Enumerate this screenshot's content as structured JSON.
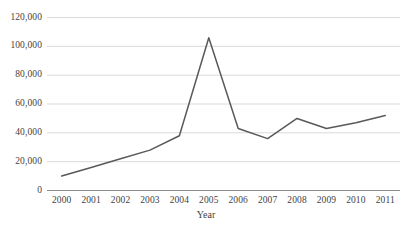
{
  "chart_data": {
    "type": "line",
    "title": "",
    "xlabel": "Year",
    "ylabel": "",
    "categories": [
      "2000",
      "2001",
      "2002",
      "2003",
      "2004",
      "2005",
      "2006",
      "2007",
      "2008",
      "2009",
      "2010",
      "2011"
    ],
    "values": [
      10000,
      16000,
      22000,
      28000,
      38000,
      106000,
      43000,
      36000,
      50000,
      43000,
      47000,
      52000
    ],
    "series": [
      {
        "name": "",
        "values": [
          10000,
          16000,
          22000,
          28000,
          38000,
          106000,
          43000,
          36000,
          50000,
          43000,
          47000,
          52000
        ]
      }
    ],
    "ylim": [
      0,
      120000
    ],
    "ytick_values": [
      0,
      20000,
      40000,
      60000,
      80000,
      100000,
      120000
    ],
    "ytick_labels": [
      "0",
      "20,000",
      "40,000",
      "60,000",
      "80,000",
      "100,000",
      "120,000"
    ],
    "grid": true,
    "grid_axis": "y",
    "legend": false,
    "legend_position": "none",
    "line_color": "#595959",
    "grid_color": "#d9d9d9",
    "axis_color": "#7f7f7f",
    "background_color": "#ffffff"
  },
  "axis": {
    "x_title": "Year"
  }
}
